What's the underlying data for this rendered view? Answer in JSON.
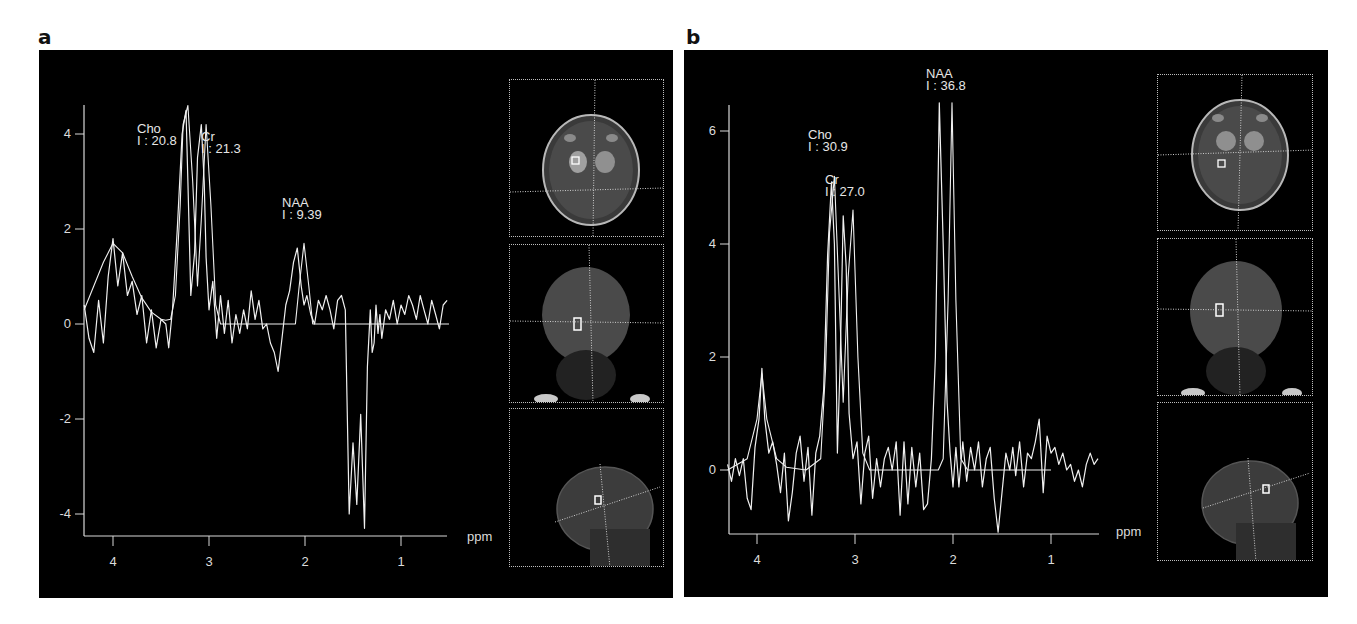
{
  "figure": {
    "panels": [
      {
        "letter": "a",
        "x_unit_label": "ppm",
        "y_ticks": [
          "4",
          "2",
          "0",
          "-2",
          "-4"
        ],
        "x_ticks": [
          "4",
          "3",
          "2",
          "1"
        ],
        "peaks": [
          {
            "name": "Cho",
            "integral": "I : 20.8"
          },
          {
            "name": "Cr",
            "integral": "I : 21.3"
          },
          {
            "name": "NAA",
            "integral": "I : 9.39"
          }
        ],
        "thumbnails": [
          "axial-mri",
          "coronal-mri",
          "sagittal-mri"
        ]
      },
      {
        "letter": "b",
        "x_unit_label": "ppm",
        "y_ticks": [
          "6",
          "4",
          "2",
          "0"
        ],
        "x_ticks": [
          "4",
          "3",
          "2",
          "1"
        ],
        "peaks": [
          {
            "name": "Cho",
            "integral": "I : 30.9"
          },
          {
            "name": "Cr",
            "integral": "I : 27.0"
          },
          {
            "name": "NAA",
            "integral": "I : 36.8"
          }
        ],
        "thumbnails": [
          "axial-mri",
          "coronal-mri",
          "sagittal-mri"
        ]
      }
    ],
    "colors": {
      "background": "#000000",
      "trace": "#f0f0f0",
      "axis": "#d8d8d8",
      "page": "#ffffff"
    }
  },
  "chart_data": [
    {
      "type": "line",
      "title": "a",
      "xlabel": "ppm",
      "ylabel": "",
      "xlim": [
        4.3,
        0.5
      ],
      "ylim": [
        -4.4,
        4.8
      ],
      "x_reversed": true,
      "grid": false,
      "x_ticks": [
        4,
        3,
        2,
        1
      ],
      "y_ticks": [
        4,
        2,
        0,
        -2,
        -4
      ],
      "annotations": [
        {
          "label": "Cho",
          "integral": 20.8,
          "x": 3.22,
          "y": 4.6
        },
        {
          "label": "Cr",
          "integral": 21.3,
          "x": 3.03,
          "y": 4.2
        },
        {
          "label": "NAA",
          "integral": 9.39,
          "x": 2.01,
          "y": 1.7
        }
      ],
      "series": [
        {
          "name": "fit",
          "x": [
            4.3,
            4.1,
            4.0,
            3.9,
            3.8,
            3.7,
            3.6,
            3.5,
            3.45,
            3.4,
            3.35,
            3.3,
            3.27,
            3.22,
            3.17,
            3.12,
            3.08,
            3.03,
            2.98,
            2.93,
            2.88,
            2.5,
            2.1,
            2.06,
            2.01,
            1.96,
            1.92,
            1.5,
            1.3,
            1.0,
            0.5
          ],
          "y": [
            0.3,
            1.3,
            1.7,
            1.5,
            1.0,
            0.55,
            0.25,
            0.1,
            0.08,
            0.1,
            0.6,
            2.5,
            4.2,
            4.6,
            3.0,
            0.8,
            2.2,
            4.2,
            2.5,
            0.4,
            0.0,
            0.0,
            0.0,
            0.8,
            1.7,
            0.8,
            0.0,
            0.0,
            0.0,
            0.0,
            0.0
          ]
        },
        {
          "name": "spectrum",
          "x": [
            4.3,
            4.25,
            4.2,
            4.15,
            4.1,
            4.05,
            4.0,
            3.95,
            3.9,
            3.85,
            3.8,
            3.75,
            3.7,
            3.65,
            3.6,
            3.55,
            3.5,
            3.45,
            3.42,
            3.38,
            3.33,
            3.28,
            3.24,
            3.22,
            3.19,
            3.15,
            3.12,
            3.08,
            3.05,
            3.03,
            3.0,
            2.96,
            2.92,
            2.88,
            2.84,
            2.8,
            2.76,
            2.72,
            2.68,
            2.64,
            2.6,
            2.56,
            2.52,
            2.48,
            2.44,
            2.4,
            2.36,
            2.32,
            2.28,
            2.24,
            2.2,
            2.16,
            2.12,
            2.08,
            2.04,
            2.01,
            1.98,
            1.94,
            1.9,
            1.86,
            1.82,
            1.78,
            1.74,
            1.7,
            1.66,
            1.62,
            1.58,
            1.54,
            1.5,
            1.46,
            1.42,
            1.38,
            1.35,
            1.32,
            1.3,
            1.28,
            1.26,
            1.24,
            1.22,
            1.2,
            1.16,
            1.12,
            1.08,
            1.04,
            1.0,
            0.96,
            0.92,
            0.88,
            0.84,
            0.8,
            0.76,
            0.72,
            0.68,
            0.64,
            0.6,
            0.56,
            0.52
          ],
          "y": [
            0.4,
            -0.3,
            -0.6,
            0.5,
            -0.4,
            1.0,
            1.8,
            0.8,
            1.5,
            0.6,
            0.9,
            0.2,
            0.6,
            -0.4,
            0.3,
            -0.5,
            0.1,
            0.0,
            -0.5,
            0.3,
            2.0,
            4.0,
            4.5,
            3.0,
            0.6,
            1.5,
            3.5,
            4.2,
            3.0,
            1.4,
            0.3,
            0.9,
            -0.3,
            0.6,
            -0.2,
            0.5,
            -0.4,
            0.2,
            -0.2,
            0.3,
            -0.1,
            0.7,
            0.1,
            0.5,
            -0.1,
            0.0,
            -0.4,
            -0.6,
            -1.0,
            -0.3,
            0.4,
            0.7,
            1.3,
            1.6,
            0.8,
            0.4,
            0.6,
            0.2,
            0.0,
            0.5,
            0.3,
            0.6,
            0.3,
            -0.1,
            0.5,
            0.6,
            0.3,
            -4.0,
            -2.5,
            -3.8,
            -1.9,
            -4.3,
            -0.9,
            0.3,
            -0.6,
            -0.4,
            0.4,
            -0.2,
            0.2,
            -0.3,
            0.3,
            0.1,
            0.5,
            0.0,
            0.4,
            0.2,
            0.6,
            0.4,
            0.1,
            0.6,
            0.3,
            0.0,
            0.5,
            0.2,
            -0.1,
            0.4,
            0.5
          ]
        }
      ]
    },
    {
      "type": "line",
      "title": "b",
      "xlabel": "ppm",
      "ylabel": "",
      "xlim": [
        4.3,
        0.5
      ],
      "ylim": [
        -1.1,
        6.5
      ],
      "x_reversed": true,
      "grid": false,
      "x_ticks": [
        4,
        3,
        2,
        1
      ],
      "y_ticks": [
        6,
        4,
        2,
        0
      ],
      "annotations": [
        {
          "label": "Cho",
          "integral": 30.9,
          "x": 3.21,
          "y": 5.2
        },
        {
          "label": "Cr",
          "integral": 27.0,
          "x": 3.02,
          "y": 4.6
        },
        {
          "label": "NAA",
          "integral": 36.8,
          "x": 2.01,
          "y": 6.5
        }
      ],
      "series": [
        {
          "name": "fit",
          "x": [
            4.3,
            4.1,
            4.0,
            3.95,
            3.9,
            3.8,
            3.7,
            3.5,
            3.35,
            3.3,
            3.26,
            3.21,
            3.16,
            3.12,
            3.07,
            3.02,
            2.97,
            2.92,
            2.85,
            2.15,
            2.1,
            2.05,
            2.01,
            1.97,
            1.92,
            1.85,
            1.0
          ],
          "y": [
            0.0,
            0.2,
            0.9,
            1.7,
            0.9,
            0.2,
            0.05,
            0.0,
            0.2,
            1.8,
            4.2,
            5.2,
            3.0,
            1.2,
            3.4,
            4.6,
            2.0,
            0.3,
            0.0,
            0.0,
            0.2,
            3.0,
            6.5,
            3.0,
            0.2,
            0.0,
            0.0
          ]
        },
        {
          "name": "spectrum",
          "x": [
            4.3,
            4.26,
            4.22,
            4.18,
            4.14,
            4.1,
            4.06,
            4.02,
            3.98,
            3.95,
            3.92,
            3.88,
            3.84,
            3.8,
            3.76,
            3.72,
            3.68,
            3.64,
            3.6,
            3.56,
            3.52,
            3.48,
            3.44,
            3.4,
            3.36,
            3.32,
            3.28,
            3.24,
            3.21,
            3.18,
            3.15,
            3.12,
            3.09,
            3.06,
            3.02,
            2.98,
            2.94,
            2.9,
            2.86,
            2.82,
            2.78,
            2.74,
            2.7,
            2.66,
            2.62,
            2.58,
            2.54,
            2.5,
            2.46,
            2.42,
            2.38,
            2.34,
            2.3,
            2.26,
            2.22,
            2.18,
            2.14,
            2.1,
            2.06,
            2.03,
            2.0,
            1.97,
            1.94,
            1.9,
            1.86,
            1.82,
            1.78,
            1.74,
            1.7,
            1.66,
            1.62,
            1.58,
            1.54,
            1.5,
            1.46,
            1.42,
            1.39,
            1.36,
            1.32,
            1.28,
            1.24,
            1.2,
            1.16,
            1.12,
            1.08,
            1.04,
            1.0,
            0.96,
            0.92,
            0.88,
            0.84,
            0.8,
            0.76,
            0.72,
            0.68,
            0.64,
            0.6,
            0.56,
            0.52
          ],
          "y": [
            0.1,
            -0.2,
            0.2,
            -0.1,
            0.2,
            -0.5,
            -0.7,
            0.4,
            0.9,
            1.8,
            0.9,
            0.3,
            0.5,
            0.1,
            -0.4,
            0.3,
            -0.9,
            -0.4,
            0.3,
            0.6,
            -0.2,
            0.4,
            -0.8,
            0.3,
            0.6,
            1.4,
            3.8,
            5.1,
            4.0,
            0.3,
            2.0,
            4.5,
            3.6,
            1.0,
            0.2,
            0.5,
            -0.6,
            0.3,
            0.6,
            -0.5,
            0.2,
            -0.3,
            0.2,
            0.4,
            0.0,
            0.5,
            -0.8,
            0.5,
            -0.6,
            0.4,
            -0.3,
            0.3,
            -0.7,
            -0.6,
            0.2,
            2.0,
            6.5,
            4.0,
            1.2,
            0.3,
            -0.3,
            0.4,
            -0.3,
            0.5,
            -0.2,
            0.4,
            0.0,
            0.5,
            -0.3,
            0.2,
            0.4,
            -0.5,
            -1.1,
            -0.4,
            0.3,
            0.0,
            0.4,
            -0.1,
            0.5,
            -0.3,
            0.3,
            0.2,
            0.5,
            0.9,
            -0.4,
            0.6,
            0.3,
            0.4,
            0.1,
            0.3,
            0.0,
            0.1,
            -0.2,
            0.0,
            -0.3,
            0.1,
            0.3,
            0.1,
            0.2
          ]
        }
      ]
    }
  ]
}
